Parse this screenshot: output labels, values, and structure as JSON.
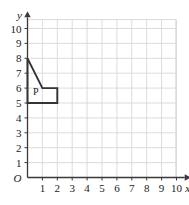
{
  "chart_data": {
    "type": "scatter",
    "title": "",
    "xlabel": "x",
    "ylabel": "y",
    "xlim": [
      0,
      10.6
    ],
    "ylim": [
      0,
      10.6
    ],
    "grid": true,
    "grid_spacing": 1,
    "legend": "none",
    "origin_label": "O",
    "x_ticks": [
      1,
      2,
      3,
      4,
      5,
      6,
      7,
      8,
      9,
      10
    ],
    "x_tick_labels": [
      "1",
      "2",
      "3",
      "4",
      "5",
      "6",
      "7",
      "8",
      "9",
      "10"
    ],
    "y_ticks": [
      1,
      2,
      3,
      4,
      5,
      6,
      7,
      8,
      9,
      10
    ],
    "y_tick_labels": [
      "1",
      "2",
      "3",
      "4",
      "5",
      "6",
      "7",
      "8",
      "9",
      "10"
    ],
    "shapes": [
      {
        "name": "P",
        "label": "P",
        "label_position": [
          0.55,
          5.55
        ],
        "vertices": [
          [
            0,
            8
          ],
          [
            1,
            6
          ],
          [
            2,
            6
          ],
          [
            2,
            5
          ],
          [
            0,
            5
          ]
        ],
        "closed": true,
        "stroke": "#333333",
        "fill": "none"
      }
    ],
    "colors": {
      "grid": "#d8d8d8",
      "axis": "#3a3a3a",
      "shape_stroke": "#333333",
      "text": "#1a1a1a",
      "background": "#ffffff"
    }
  },
  "figure": {
    "axis_x_name": "x",
    "axis_y_name": "y",
    "origin": "O"
  }
}
